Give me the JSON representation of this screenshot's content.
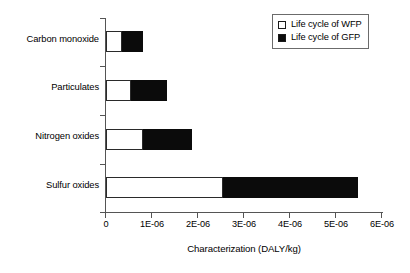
{
  "chart_data": {
    "type": "bar",
    "orientation": "horizontal",
    "stacked": true,
    "title": "",
    "xlabel": "Characterization (DALY/kg)",
    "ylabel": "",
    "categories": [
      "Carbon monoxide",
      "Particulates",
      "Nitrogen oxides",
      "Sulfur oxides"
    ],
    "series": [
      {
        "name": "Life cycle of WFP",
        "color": "#ffffff",
        "values": [
          3.5e-07,
          5.4e-07,
          8e-07,
          2.54e-06
        ]
      },
      {
        "name": "Life cycle of GFP",
        "color": "#000000",
        "values": [
          4.5e-07,
          7.9e-07,
          1.07e-06,
          2.94e-06
        ]
      }
    ],
    "totals": [
      8e-07,
      1.33e-06,
      1.87e-06,
      5.48e-06
    ],
    "xlim": [
      0,
      6e-06
    ],
    "xticks": [
      0,
      1e-06,
      2e-06,
      3e-06,
      4e-06,
      5e-06,
      6e-06
    ],
    "xticklabels": [
      "0",
      "1E-06",
      "2E-06",
      "3E-06",
      "4E-06",
      "5E-06",
      "6E-06"
    ],
    "grid": false,
    "legend_position": "top-right"
  },
  "axis": {
    "x_title": "Characterization (DALY/kg)",
    "ticklabels": [
      "0",
      "1E-06",
      "2E-06",
      "3E-06",
      "4E-06",
      "5E-06",
      "6E-06"
    ]
  },
  "categories": [
    {
      "label": "Carbon monoxide"
    },
    {
      "label": "Particulates"
    },
    {
      "label": "Nitrogen oxides"
    },
    {
      "label": "Sulfur oxides"
    }
  ],
  "legend": {
    "items": [
      {
        "label": "Life cycle of WFP",
        "swatch": "white-square-icon"
      },
      {
        "label": "Life cycle of GFP",
        "swatch": "black-square-icon"
      }
    ]
  },
  "colors": {
    "wfp": "#ffffff",
    "gfp": "#000000",
    "axis": "#555555",
    "outline": "#2a2a2a"
  }
}
